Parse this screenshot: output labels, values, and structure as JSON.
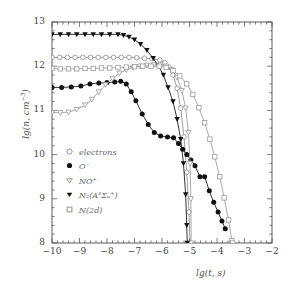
{
  "chart_data": {
    "type": "line",
    "title": "",
    "xlabel": "lg(t, s)",
    "ylabel": "lg(n, cm^-3)",
    "xlim": [
      -10,
      -2
    ],
    "ylim": [
      8,
      13
    ],
    "xticks": [
      "-10",
      "-9",
      "-8",
      "-7",
      "-6",
      "-5",
      "-4",
      "-3",
      "-2"
    ],
    "yticks": [
      "8",
      "9",
      "10",
      "11",
      "12",
      "13"
    ],
    "grid": false,
    "legend_position": "lower-left-inside",
    "minor_ticks": true,
    "series": [
      {
        "name": "electrons",
        "marker": "open-circle",
        "color": "#8a8a8a",
        "points": [
          [
            -10.0,
            12.2
          ],
          [
            -9.72,
            12.2
          ],
          [
            -9.44,
            12.2
          ],
          [
            -9.16,
            12.2
          ],
          [
            -8.88,
            12.2
          ],
          [
            -8.6,
            12.2
          ],
          [
            -8.32,
            12.2
          ],
          [
            -8.04,
            12.2
          ],
          [
            -7.76,
            12.2
          ],
          [
            -7.48,
            12.2
          ],
          [
            -7.2,
            12.2
          ],
          [
            -6.92,
            12.19
          ],
          [
            -6.64,
            12.18
          ],
          [
            -6.36,
            12.17
          ],
          [
            -6.08,
            12.14
          ],
          [
            -5.9,
            12.08
          ],
          [
            -5.75,
            11.98
          ],
          [
            -5.6,
            11.8
          ],
          [
            -5.45,
            11.5
          ],
          [
            -5.32,
            11.05
          ],
          [
            -5.2,
            10.4
          ],
          [
            -5.1,
            9.6
          ],
          [
            -5.02,
            8.7
          ],
          [
            -4.98,
            8.0
          ]
        ]
      },
      {
        "name": "O-",
        "marker": "filled-circle",
        "color": "#111111",
        "points": [
          [
            -10.0,
            11.52
          ],
          [
            -9.65,
            11.52
          ],
          [
            -9.3,
            11.53
          ],
          [
            -8.95,
            11.55
          ],
          [
            -8.62,
            11.6
          ],
          [
            -8.3,
            11.62
          ],
          [
            -8.0,
            11.63
          ],
          [
            -7.72,
            11.64
          ],
          [
            -7.5,
            11.66
          ],
          [
            -7.3,
            11.6
          ],
          [
            -7.12,
            11.42
          ],
          [
            -6.95,
            11.22
          ],
          [
            -6.72,
            10.92
          ],
          [
            -6.5,
            10.68
          ],
          [
            -6.28,
            10.5
          ],
          [
            -6.05,
            10.42
          ],
          [
            -5.8,
            10.4
          ],
          [
            -5.58,
            10.38
          ],
          [
            -5.4,
            10.25
          ],
          [
            -5.25,
            10.12
          ],
          [
            -5.1,
            10.0
          ],
          [
            -4.95,
            9.88
          ],
          [
            -4.8,
            9.75
          ],
          [
            -4.62,
            9.5
          ],
          [
            -4.45,
            9.5
          ],
          [
            -4.28,
            9.18
          ],
          [
            -4.12,
            8.92
          ],
          [
            -3.96,
            8.7
          ],
          [
            -3.82,
            8.5
          ],
          [
            -3.7,
            8.32
          ]
        ]
      },
      {
        "name": "NO+",
        "marker": "open-down-triangle",
        "color": "#9a9a9a",
        "points": [
          [
            -10.0,
            10.95
          ],
          [
            -9.7,
            10.95
          ],
          [
            -9.4,
            10.96
          ],
          [
            -9.1,
            11.02
          ],
          [
            -8.8,
            11.12
          ],
          [
            -8.55,
            11.25
          ],
          [
            -8.3,
            11.42
          ],
          [
            -8.05,
            11.58
          ],
          [
            -7.8,
            11.72
          ],
          [
            -7.55,
            11.84
          ],
          [
            -7.3,
            11.92
          ],
          [
            -7.05,
            11.97
          ],
          [
            -6.8,
            12.0
          ],
          [
            -6.55,
            12.02
          ],
          [
            -6.3,
            12.03
          ],
          [
            -6.05,
            12.03
          ],
          [
            -5.85,
            12.0
          ],
          [
            -5.65,
            11.92
          ],
          [
            -5.45,
            11.75
          ],
          [
            -5.28,
            11.45
          ],
          [
            -5.14,
            11.05
          ],
          [
            -5.04,
            10.5
          ],
          [
            -4.98,
            9.8
          ],
          [
            -4.95,
            9.0
          ],
          [
            -4.94,
            8.0
          ]
        ]
      },
      {
        "name": "N2(A3Sigma_u+)",
        "marker": "filled-down-triangle",
        "color": "#111111",
        "points": [
          [
            -10.0,
            12.72
          ],
          [
            -9.7,
            12.72
          ],
          [
            -9.4,
            12.72
          ],
          [
            -9.1,
            12.72
          ],
          [
            -8.8,
            12.72
          ],
          [
            -8.5,
            12.72
          ],
          [
            -8.2,
            12.72
          ],
          [
            -7.9,
            12.72
          ],
          [
            -7.6,
            12.72
          ],
          [
            -7.4,
            12.7
          ],
          [
            -7.2,
            12.66
          ],
          [
            -7.0,
            12.6
          ],
          [
            -6.78,
            12.5
          ],
          [
            -6.55,
            12.36
          ],
          [
            -6.32,
            12.18
          ],
          [
            -6.12,
            12.0
          ],
          [
            -5.95,
            11.8
          ],
          [
            -5.78,
            11.52
          ],
          [
            -5.6,
            11.2
          ],
          [
            -5.45,
            10.8
          ],
          [
            -5.32,
            10.35
          ],
          [
            -5.22,
            9.8
          ],
          [
            -5.14,
            9.1
          ],
          [
            -5.1,
            8.4
          ],
          [
            -5.08,
            8.0
          ]
        ]
      },
      {
        "name": "N(2d)",
        "marker": "open-square",
        "color": "#9a9a9a",
        "points": [
          [
            -10.0,
            11.95
          ],
          [
            -9.7,
            11.94
          ],
          [
            -9.4,
            11.94
          ],
          [
            -9.1,
            11.94
          ],
          [
            -8.8,
            11.95
          ],
          [
            -8.5,
            11.95
          ],
          [
            -8.2,
            11.96
          ],
          [
            -7.9,
            11.96
          ],
          [
            -7.6,
            11.97
          ],
          [
            -7.3,
            11.98
          ],
          [
            -7.0,
            11.99
          ],
          [
            -6.7,
            12.0
          ],
          [
            -6.4,
            12.0
          ],
          [
            -6.1,
            12.0
          ],
          [
            -5.85,
            11.97
          ],
          [
            -5.6,
            11.9
          ],
          [
            -5.35,
            11.78
          ],
          [
            -5.1,
            11.6
          ],
          [
            -4.88,
            11.36
          ],
          [
            -4.66,
            11.06
          ],
          [
            -4.45,
            10.72
          ],
          [
            -4.26,
            10.35
          ],
          [
            -4.08,
            9.95
          ],
          [
            -3.9,
            9.5
          ],
          [
            -3.74,
            9.02
          ],
          [
            -3.58,
            8.52
          ],
          [
            -3.46,
            8.05
          ],
          [
            -3.43,
            8.0
          ]
        ]
      }
    ],
    "legend": [
      {
        "label": "electrons",
        "marker": "open-circle"
      },
      {
        "label": "O⁻",
        "marker": "filled-circle"
      },
      {
        "label": "NO⁺",
        "marker": "open-down-triangle"
      },
      {
        "label": "N₂(A³Σᵤ⁺)",
        "marker": "filled-down-triangle"
      },
      {
        "label": "N(2d)",
        "marker": "open-square"
      }
    ]
  },
  "axes": {
    "x_label": "lg(t, s)",
    "y_label_parts": {
      "prefix": "lg(n, cm",
      "sup": "-3",
      "suffix": ")"
    }
  }
}
